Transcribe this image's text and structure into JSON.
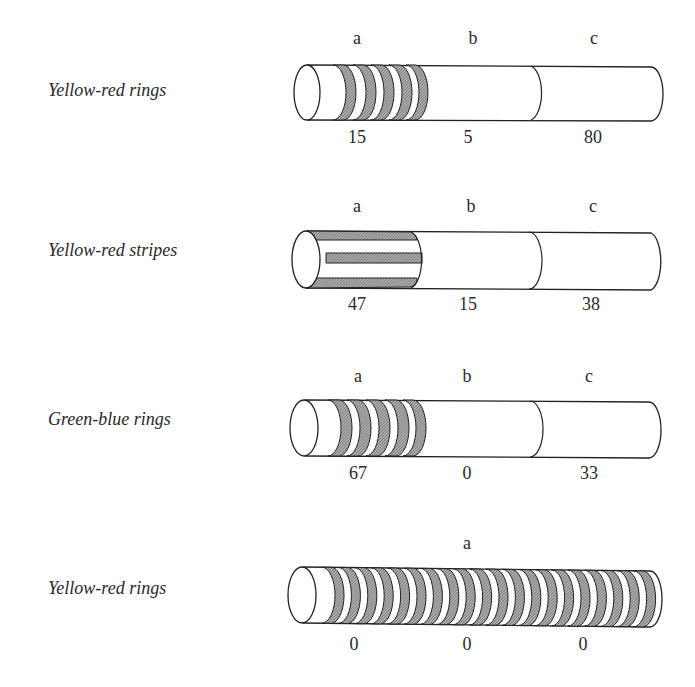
{
  "rows": [
    {
      "label": "Yellow-red rings",
      "pattern": "rings",
      "segments": [
        {
          "name": "a",
          "value": "15"
        },
        {
          "name": "b",
          "value": "5"
        },
        {
          "name": "c",
          "value": "80"
        }
      ]
    },
    {
      "label": "Yellow-red stripes",
      "pattern": "stripes",
      "segments": [
        {
          "name": "a",
          "value": "47"
        },
        {
          "name": "b",
          "value": "15"
        },
        {
          "name": "c",
          "value": "38"
        }
      ]
    },
    {
      "label": "Green-blue rings",
      "pattern": "rings",
      "segments": [
        {
          "name": "a",
          "value": "67"
        },
        {
          "name": "b",
          "value": "0"
        },
        {
          "name": "c",
          "value": "33"
        }
      ]
    },
    {
      "label": "Yellow-red rings",
      "pattern": "rings-full",
      "segments": [
        {
          "name": "a",
          "value": "0"
        },
        {
          "name": "",
          "value": "0"
        },
        {
          "name": "",
          "value": "0"
        }
      ]
    }
  ],
  "colors": {
    "stroke": "#222222",
    "shade": "#9a9a9a",
    "background": "#ffffff"
  }
}
